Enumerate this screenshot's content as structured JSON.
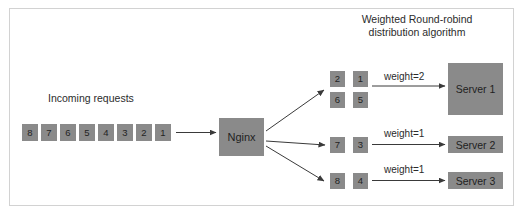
{
  "title": {
    "line1": "Weighted Round-robind",
    "line2": "distribution algorithm"
  },
  "incoming": {
    "label": "Incoming requests",
    "requests": [
      "8",
      "7",
      "6",
      "5",
      "4",
      "3",
      "2",
      "1"
    ]
  },
  "balancer": {
    "label": "Nginx"
  },
  "branches": [
    {
      "queue": [
        "2",
        "1",
        "6",
        "5"
      ],
      "weight_label": "weight=2",
      "server_label": "Server 1"
    },
    {
      "queue": [
        "7",
        "3"
      ],
      "weight_label": "weight=1",
      "server_label": "Server 2"
    },
    {
      "queue": [
        "8",
        "4"
      ],
      "weight_label": "weight=1",
      "server_label": "Server 3"
    }
  ],
  "colors": {
    "box_fill": "#8a8a8a",
    "text": "#232323",
    "arrow": "#3a3a3a",
    "frame": "#d2d2d2"
  }
}
